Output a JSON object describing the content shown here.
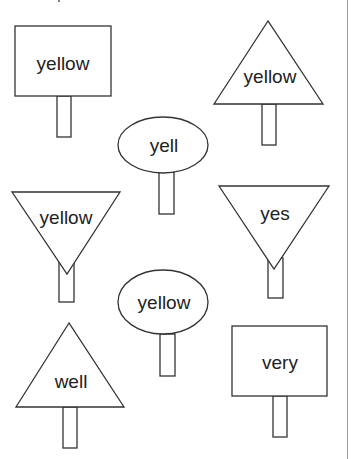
{
  "worksheet": {
    "signs": [
      {
        "id": "sign-1",
        "shape": "rectangle",
        "word": "yellow"
      },
      {
        "id": "sign-2",
        "shape": "triangle-up",
        "word": "yellow"
      },
      {
        "id": "sign-3",
        "shape": "oval",
        "word": "yell"
      },
      {
        "id": "sign-4",
        "shape": "triangle-down",
        "word": "yellow"
      },
      {
        "id": "sign-5",
        "shape": "triangle-down",
        "word": "yes"
      },
      {
        "id": "sign-6",
        "shape": "oval",
        "word": "yellow"
      },
      {
        "id": "sign-7",
        "shape": "triangle-up",
        "word": "well"
      },
      {
        "id": "sign-8",
        "shape": "rectangle",
        "word": "very"
      }
    ]
  },
  "colors": {
    "stroke": "#333333",
    "text": "#222222",
    "background": "#ffffff",
    "edge_line": "#9a9a9a"
  }
}
